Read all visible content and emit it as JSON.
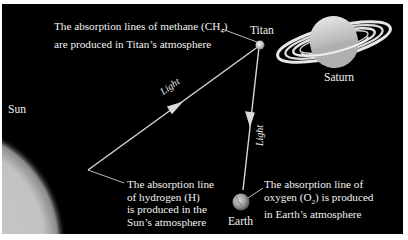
{
  "figure": {
    "background_color": "#000000",
    "bodies": {
      "sun": {
        "label": "Sun"
      },
      "titan": {
        "label": "Titan"
      },
      "saturn": {
        "label": "Saturn"
      },
      "earth": {
        "label": "Earth"
      }
    },
    "light_labels": {
      "sun_to_titan": "Light",
      "titan_to_earth": "Light"
    },
    "annotations": {
      "methane": {
        "line1": "The absorption lines of methane (CH",
        "sub": "4",
        "line1_end": ")",
        "line2": "are produced in Titan’s atmosphere"
      },
      "hydrogen": {
        "line1": "The absorption line",
        "line2": "of hydrogen (H)",
        "line3": "is produced in the",
        "line4": "Sun’s atmosphere"
      },
      "oxygen": {
        "line1": "The absorption line of",
        "line2_pre": "oxygen (O",
        "sub": "2",
        "line2_post": ") is produced",
        "line3": "in Earth’s atmosphere"
      }
    }
  }
}
